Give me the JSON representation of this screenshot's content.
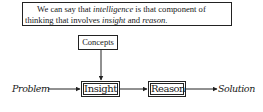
{
  "quote": {
    "line1_pre": "We can say that ",
    "term_intelligence": "intelligence",
    "line1_post": " is that component of",
    "line2_pre": "thinking that involves ",
    "term_insight": "insight",
    "line2_mid": " and ",
    "term_reason": "reason",
    "line2_post": "."
  },
  "diagram": {
    "nodes": {
      "concepts": "Concepts",
      "insight": "Insight",
      "reason": "Reason"
    },
    "input_label": "Problem",
    "output_label": "Solution",
    "edges": [
      {
        "from": "Concepts",
        "to": "Insight"
      },
      {
        "from": "Problem",
        "to": "Insight"
      },
      {
        "from": "Insight",
        "to": "Reason"
      },
      {
        "from": "Reason",
        "to": "Solution"
      }
    ]
  }
}
